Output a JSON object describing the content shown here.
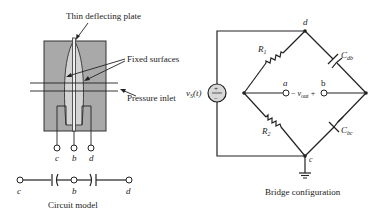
{
  "sensor": {
    "labels": {
      "plate": "Thin deflecting plate",
      "fixed": "Fixed surfaces",
      "inlet": "Pressure inlet"
    },
    "terminals": [
      "c",
      "b",
      "d"
    ],
    "body_color": "#a9a9a9",
    "plate_color": "#d4d4d4"
  },
  "circuit_model": {
    "nodes": [
      "c",
      "b",
      "d"
    ],
    "caption": "Circuit model"
  },
  "bridge": {
    "source_label_main": "v",
    "source_label_sub": "S",
    "source_label_arg": "(t)",
    "source_plus": "+",
    "source_minus": "−",
    "node_top": "d",
    "node_bottom": "c",
    "node_a": "a",
    "node_b": "b",
    "r1_main": "R",
    "r1_sub": "1",
    "r2_main": "R",
    "r2_sub": "2",
    "cdb_main": "C",
    "cdb_sub": "db",
    "cbc_main": "C",
    "cbc_sub": "bc",
    "vout_minus": "−",
    "vout_main": "v",
    "vout_sub": "out",
    "vout_plus": "+",
    "caption": "Bridge configuration"
  }
}
